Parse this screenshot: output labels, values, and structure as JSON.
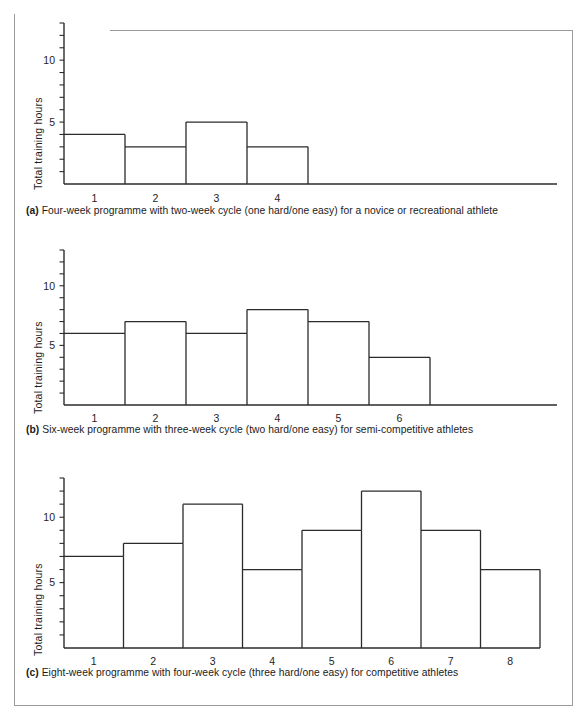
{
  "figure": {
    "background": "#ffffff",
    "frame_color": "#9a9a9a",
    "line_color": "#2b2b2b"
  },
  "panels": [
    {
      "id": "a",
      "caption_label": "(a)",
      "caption_text": "Four-week programme with two-week cycle (one hard/one easy) for a novice or recreational athlete",
      "ylabel": "Total training hours"
    },
    {
      "id": "b",
      "caption_label": "(b)",
      "caption_text": "Six-week programme with three-week cycle (two hard/one easy) for semi-competitive athletes",
      "ylabel": "Total training hours"
    },
    {
      "id": "c",
      "caption_label": "(c)",
      "caption_text": "Eight-week programme with four-week cycle (three hard/one easy) for competitive athletes",
      "ylabel": "Total training hours"
    }
  ],
  "chart_data": [
    {
      "type": "bar",
      "panel": "a",
      "title": "",
      "xlabel": "",
      "ylabel": "Total training hours",
      "categories": [
        "1",
        "2",
        "3",
        "4"
      ],
      "values": [
        4,
        3,
        5,
        3
      ],
      "ylim": [
        0,
        13
      ],
      "ytick_labels": [
        "5",
        "10"
      ],
      "ytick_values": [
        5,
        10
      ],
      "yminor_step": 1,
      "grid": false,
      "legend": "none",
      "axis_extends_past_bars": true
    },
    {
      "type": "bar",
      "panel": "b",
      "title": "",
      "xlabel": "",
      "ylabel": "Total training hours",
      "categories": [
        "1",
        "2",
        "3",
        "4",
        "5",
        "6"
      ],
      "values": [
        6,
        7,
        6,
        8,
        7,
        4
      ],
      "ylim": [
        0,
        13
      ],
      "ytick_labels": [
        "5",
        "10"
      ],
      "ytick_values": [
        5,
        10
      ],
      "yminor_step": 1,
      "grid": false,
      "legend": "none",
      "axis_extends_past_bars": true
    },
    {
      "type": "bar",
      "panel": "c",
      "title": "",
      "xlabel": "",
      "ylabel": "Total training hours",
      "categories": [
        "1",
        "2",
        "3",
        "4",
        "5",
        "6",
        "7",
        "8"
      ],
      "values": [
        7,
        8,
        11,
        6,
        9,
        12,
        9,
        6
      ],
      "ylim": [
        0,
        13
      ],
      "ytick_labels": [
        "5",
        "10"
      ],
      "ytick_values": [
        5,
        10
      ],
      "yminor_step": 1,
      "grid": false,
      "legend": "none",
      "axis_extends_past_bars": false
    }
  ]
}
